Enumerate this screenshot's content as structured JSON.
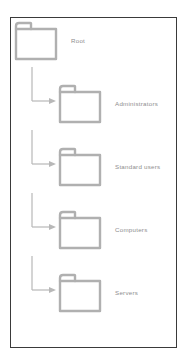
{
  "diagram": {
    "colors": {
      "panel_border": "#3a3a3a",
      "folder_stroke": "#b0b0b0",
      "connector": "#b8b8b8",
      "label_text": "#8e8e8e",
      "background": "#ffffff"
    },
    "root": {
      "id": "root",
      "label": "Root",
      "icon": "folder-icon"
    },
    "children": [
      {
        "id": "administrators",
        "label": "Administrators",
        "icon": "folder-icon",
        "connector": "elbow-arrow-icon"
      },
      {
        "id": "standard-users",
        "label": "Standard users",
        "icon": "folder-icon",
        "connector": "elbow-arrow-icon"
      },
      {
        "id": "computers",
        "label": "Computers",
        "icon": "folder-icon",
        "connector": "elbow-arrow-icon"
      },
      {
        "id": "servers",
        "label": "Servers",
        "icon": "folder-icon",
        "connector": "elbow-arrow-icon"
      }
    ]
  }
}
